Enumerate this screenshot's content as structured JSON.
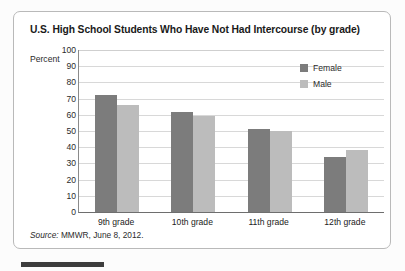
{
  "title": "U.S. High School Students Who Have Not Had Intercourse (by grade)",
  "axis": {
    "y_axis_label": "Percent",
    "y_ticks": [
      "100",
      "90",
      "80",
      "70",
      "60",
      "50",
      "40",
      "30",
      "20",
      "10",
      "0"
    ]
  },
  "legend": {
    "items": [
      {
        "label": "Female",
        "color": "#7c7c7c"
      },
      {
        "label": "Male",
        "color": "#bcbcbc"
      }
    ]
  },
  "source": {
    "prefix": "Source:",
    "text": "MMWR, June 8, 2012."
  },
  "chart_data": {
    "type": "bar",
    "title": "U.S. High School Students Who Have Not Had Intercourse (by grade)",
    "xlabel": "",
    "ylabel": "Percent",
    "ylim": [
      0,
      100
    ],
    "ytick_step": 10,
    "grid": true,
    "legend_position": "top-right",
    "categories": [
      "9th grade",
      "10th grade",
      "11th grade",
      "12th grade"
    ],
    "series": [
      {
        "name": "Female",
        "color": "#7c7c7c",
        "values": [
          72,
          62,
          51,
          34
        ]
      },
      {
        "name": "Male",
        "color": "#bcbcbc",
        "values": [
          66,
          59,
          50,
          38
        ]
      }
    ]
  }
}
